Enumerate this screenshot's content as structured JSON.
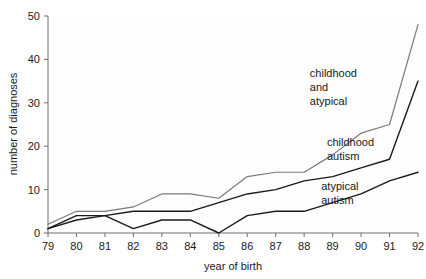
{
  "chart_data": {
    "type": "line",
    "title": "",
    "xlabel": "year of birth",
    "ylabel": "number of diagnoses",
    "x": [
      79,
      80,
      81,
      82,
      83,
      84,
      85,
      86,
      87,
      88,
      89,
      90,
      91,
      92
    ],
    "categories": [
      "79",
      "80",
      "81",
      "82",
      "83",
      "84",
      "85",
      "86",
      "87",
      "88",
      "89",
      "90",
      "91",
      "92"
    ],
    "xlim": [
      79,
      92
    ],
    "ylim": [
      0,
      50
    ],
    "yticks": [
      0,
      10,
      20,
      30,
      40,
      50
    ],
    "ytick_labels": [
      "0",
      "10",
      "20",
      "30",
      "40",
      "50"
    ],
    "xticks": [
      79,
      80,
      81,
      82,
      83,
      84,
      85,
      86,
      87,
      88,
      89,
      90,
      91,
      92
    ],
    "grid": false,
    "legend_position": "inline-annotations",
    "series": [
      {
        "name": "childhood and atypical",
        "color": "#7a7a7a",
        "values": [
          2,
          5,
          5,
          6,
          9,
          9,
          8,
          13,
          14,
          14,
          18,
          23,
          25,
          48
        ]
      },
      {
        "name": "childhood autism",
        "color": "#1a1a1a",
        "values": [
          1,
          3,
          4,
          5,
          5,
          5,
          7,
          9,
          10,
          12,
          13,
          15,
          17,
          35
        ]
      },
      {
        "name": "atypical autism",
        "color": "#1a1a1a",
        "values": [
          1,
          4,
          4,
          1,
          3,
          3,
          0,
          4,
          5,
          5,
          7,
          9,
          12,
          14
        ]
      }
    ],
    "annotations": [
      {
        "name": "childhood-and-atypical-label",
        "lines": [
          "childhood",
          "and",
          "atypical"
        ],
        "x": 88.2,
        "y": 36
      },
      {
        "name": "childhood-autism-label",
        "lines": [
          "childhood",
          "autism"
        ],
        "x": 88.8,
        "y": 20
      },
      {
        "name": "atypical-autism-label",
        "lines": [
          "atypical",
          "autism"
        ],
        "x": 88.6,
        "y": 10
      }
    ]
  }
}
